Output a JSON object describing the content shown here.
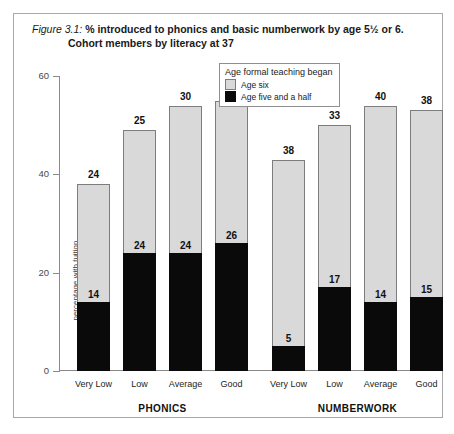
{
  "figure": {
    "number_label": "Figure 3.1:",
    "title_line1": "% introduced to phonics and basic numberwork by age 5½ or 6.",
    "title_line2": "Cohort members by literacy at 37"
  },
  "legend": {
    "title": "Age formal teaching began",
    "items": [
      {
        "label": "Age six",
        "color": "#d9d9d9"
      },
      {
        "label": "Age five and a half",
        "color": "#0a0a0a"
      }
    ]
  },
  "axes": {
    "y_title": "percentage with tuition",
    "y_ticks": [
      "0",
      "20",
      "40",
      "60"
    ],
    "y_min": 0,
    "y_max": 60
  },
  "groups": [
    {
      "name": "PHONICS"
    },
    {
      "name": "NUMBERWORK"
    }
  ],
  "chart_data": {
    "type": "bar",
    "title": "Figure 3.1: % introduced to phonics and basic numberwork by age 5½ or 6. Cohort members by literacy at 37",
    "xlabel": "",
    "ylabel": "percentage with tuition",
    "ylim": [
      0,
      60
    ],
    "grid": false,
    "stacked": true,
    "legend_position": "top-center",
    "legend_title": "Age formal teaching began",
    "groups": [
      "PHONICS",
      "NUMBERWORK"
    ],
    "categories": [
      "Very Low",
      "Low",
      "Average",
      "Good"
    ],
    "series": [
      {
        "name": "Age five and a half",
        "color": "#0a0a0a",
        "values_by_group": {
          "PHONICS": [
            14,
            24,
            24,
            26
          ],
          "NUMBERWORK": [
            5,
            17,
            14,
            15
          ]
        }
      },
      {
        "name": "Age six",
        "color": "#d9d9d9",
        "values_by_group": {
          "PHONICS": [
            24,
            25,
            30,
            29
          ],
          "NUMBERWORK": [
            38,
            33,
            40,
            38
          ]
        }
      }
    ],
    "totals_by_group": {
      "PHONICS": [
        38,
        49,
        54,
        55
      ],
      "NUMBERWORK": [
        43,
        50,
        54,
        53
      ]
    }
  }
}
